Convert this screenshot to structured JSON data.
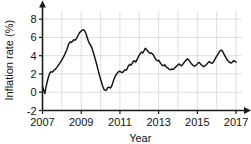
{
  "chart_data": {
    "type": "line",
    "title": "",
    "xlabel": "Year",
    "ylabel": "Inflation rate (%)",
    "xlim": [
      2007,
      2017.1
    ],
    "ylim": [
      -2,
      9
    ],
    "xticks": [
      2007,
      2009,
      2011,
      2013,
      2015,
      2017
    ],
    "xtick_labels": [
      "2007",
      "2009",
      "2011",
      "2013",
      "2015",
      "2017"
    ],
    "yticks": [
      -2,
      0,
      2,
      4,
      6,
      8
    ],
    "ytick_labels": [
      "-2",
      "0",
      "2",
      "4",
      "6",
      "8"
    ],
    "grid": true,
    "grid_x_step": 1,
    "legend": null,
    "series": [
      {
        "name": "Inflation rate",
        "color": "#111111",
        "x": [
          2007.0,
          2007.06,
          2007.12,
          2007.18,
          2007.25,
          2007.31,
          2007.37,
          2007.43,
          2007.5,
          2007.56,
          2007.62,
          2007.68,
          2007.75,
          2007.81,
          2007.87,
          2007.93,
          2008.0,
          2008.06,
          2008.12,
          2008.18,
          2008.25,
          2008.31,
          2008.37,
          2008.43,
          2008.5,
          2008.56,
          2008.62,
          2008.68,
          2008.75,
          2008.81,
          2008.87,
          2008.93,
          2009.0,
          2009.06,
          2009.12,
          2009.18,
          2009.25,
          2009.31,
          2009.37,
          2009.43,
          2009.5,
          2009.56,
          2009.62,
          2009.68,
          2009.75,
          2009.81,
          2009.87,
          2009.93,
          2010.0,
          2010.06,
          2010.12,
          2010.18,
          2010.25,
          2010.31,
          2010.37,
          2010.43,
          2010.5,
          2010.56,
          2010.62,
          2010.68,
          2010.75,
          2010.81,
          2010.87,
          2010.93,
          2011.0,
          2011.06,
          2011.12,
          2011.18,
          2011.25,
          2011.31,
          2011.37,
          2011.43,
          2011.5,
          2011.56,
          2011.62,
          2011.68,
          2011.75,
          2011.81,
          2011.87,
          2011.93,
          2012.0,
          2012.06,
          2012.12,
          2012.18,
          2012.25,
          2012.31,
          2012.37,
          2012.43,
          2012.5,
          2012.56,
          2012.62,
          2012.68,
          2012.75,
          2012.81,
          2012.87,
          2012.93,
          2013.0,
          2013.06,
          2013.12,
          2013.18,
          2013.25,
          2013.31,
          2013.37,
          2013.43,
          2013.5,
          2013.56,
          2013.62,
          2013.68,
          2013.75,
          2013.81,
          2013.87,
          2013.93,
          2014.0,
          2014.06,
          2014.12,
          2014.18,
          2014.25,
          2014.31,
          2014.37,
          2014.43,
          2014.5,
          2014.56,
          2014.62,
          2014.68,
          2014.75,
          2014.81,
          2014.87,
          2014.93,
          2015.0,
          2015.06,
          2015.12,
          2015.18,
          2015.25,
          2015.31,
          2015.37,
          2015.43,
          2015.5,
          2015.56,
          2015.62,
          2015.68,
          2015.75,
          2015.81,
          2015.87,
          2015.93,
          2016.0,
          2016.06,
          2016.12,
          2016.18,
          2016.25,
          2016.31,
          2016.37,
          2016.43,
          2016.5,
          2016.56,
          2016.62,
          2016.68,
          2016.75,
          2016.81,
          2016.87,
          2016.93,
          2017.0
        ],
        "y": [
          0.6,
          0.25,
          -0.15,
          0.55,
          1.2,
          1.7,
          2.05,
          2.25,
          2.2,
          2.3,
          2.45,
          2.55,
          2.75,
          2.95,
          3.1,
          3.3,
          3.55,
          3.75,
          4.0,
          4.3,
          4.6,
          5.0,
          5.35,
          5.5,
          5.45,
          5.6,
          5.75,
          5.7,
          5.85,
          6.1,
          6.35,
          6.55,
          6.7,
          6.8,
          6.85,
          6.7,
          6.4,
          6.0,
          5.6,
          5.3,
          5.1,
          4.8,
          4.4,
          3.95,
          3.45,
          2.95,
          2.45,
          1.95,
          1.45,
          1.0,
          0.6,
          0.3,
          0.2,
          0.25,
          0.5,
          0.55,
          0.45,
          0.6,
          0.95,
          1.35,
          1.7,
          1.95,
          2.1,
          2.25,
          2.3,
          2.2,
          2.15,
          2.25,
          2.45,
          2.4,
          2.55,
          2.85,
          3.05,
          2.95,
          3.1,
          3.35,
          3.45,
          3.3,
          3.5,
          3.8,
          4.05,
          4.25,
          4.4,
          4.3,
          4.55,
          4.8,
          4.7,
          4.5,
          4.35,
          4.25,
          4.3,
          4.2,
          4.0,
          3.75,
          3.55,
          3.45,
          3.5,
          3.3,
          3.1,
          2.95,
          2.9,
          3.0,
          2.85,
          2.7,
          2.6,
          2.5,
          2.45,
          2.55,
          2.5,
          2.6,
          2.75,
          2.85,
          3.0,
          3.1,
          2.95,
          2.9,
          3.05,
          3.25,
          3.4,
          3.55,
          3.65,
          3.5,
          3.35,
          3.15,
          3.0,
          2.9,
          2.85,
          2.95,
          3.1,
          3.25,
          3.2,
          3.05,
          2.9,
          2.8,
          2.85,
          2.95,
          3.1,
          3.25,
          3.35,
          3.25,
          3.15,
          3.25,
          3.45,
          3.7,
          3.95,
          4.15,
          4.35,
          4.55,
          4.6,
          4.45,
          4.2,
          3.95,
          3.7,
          3.5,
          3.35,
          3.25,
          3.2,
          3.3,
          3.45,
          3.4,
          3.3
        ]
      }
    ]
  }
}
